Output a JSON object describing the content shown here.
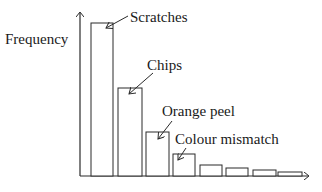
{
  "chart_data": {
    "type": "bar",
    "title": "",
    "xlabel": "",
    "ylabel": "Frequency",
    "categories": [
      "Scratches",
      "Chips",
      "Orange peel",
      "Colour mismatch",
      "",
      "",
      "",
      ""
    ],
    "values": [
      153,
      88,
      44,
      22,
      11,
      8,
      6,
      4
    ],
    "annotations": [
      {
        "text": "Scratches",
        "bar_index": 0
      },
      {
        "text": "Chips",
        "bar_index": 1
      },
      {
        "text": "Orange peel",
        "bar_index": 2
      },
      {
        "text": "Colour mismatch",
        "bar_index": 3
      }
    ],
    "grid": false,
    "axis_ticks": false,
    "legend": "none",
    "sorted": "descending (Pareto-style)"
  },
  "labels": {
    "ylabel": "Frequency",
    "a0": "Scratches",
    "a1": "Chips",
    "a2": "Orange peel",
    "a3": "Colour mismatch"
  },
  "colors": {
    "stroke": "#2a2a2a",
    "fill": "#ffffff"
  }
}
